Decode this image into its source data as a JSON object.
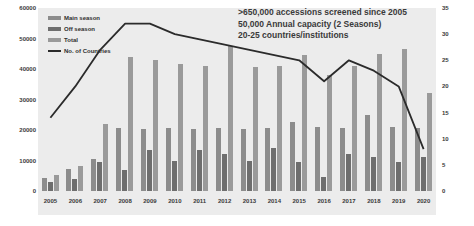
{
  "chart_data": {
    "type": "bar",
    "title": "",
    "annotations": [
      ">650,000 accessions screened since 2005",
      "50,000 Annual capacity (2 Seasons)",
      "20-25 countries/institutions"
    ],
    "categories": [
      "2005",
      "2006",
      "2007",
      "2008",
      "2009",
      "2010",
      "2011",
      "2012",
      "2013",
      "2014",
      "2015",
      "2016",
      "2017",
      "2018",
      "2019",
      "2020"
    ],
    "xlabel": "",
    "ylabel": "",
    "ylim": [
      0,
      60000
    ],
    "yticks": [
      "0",
      "10000",
      "20000",
      "30000",
      "40000",
      "50000",
      "60000"
    ],
    "y2lim": [
      0,
      35
    ],
    "y2ticks": [
      "0",
      "5",
      "10",
      "15",
      "20",
      "25",
      "30",
      "35"
    ],
    "grid": false,
    "legend_position": "top-left",
    "series": [
      {
        "name": "Main season",
        "type": "bar",
        "color": "#8c8c8c",
        "values": [
          4200,
          7200,
          10600,
          20500,
          20200,
          20600,
          20400,
          20700,
          20200,
          20500,
          22500,
          21000,
          20800,
          25000,
          21000,
          20500
        ]
      },
      {
        "name": "Off season",
        "type": "bar",
        "color": "#6e6e6e",
        "values": [
          3000,
          4000,
          9500,
          7000,
          13500,
          10000,
          13500,
          12000,
          9700,
          14000,
          9500,
          4700,
          12000,
          11000,
          9500,
          11000
        ]
      },
      {
        "name": "Total",
        "type": "bar",
        "color": "#9a9a9a",
        "values": [
          5200,
          8200,
          22000,
          44000,
          43000,
          41500,
          41000,
          47500,
          40500,
          41000,
          44500,
          38000,
          41000,
          45000,
          46500,
          32000
        ]
      },
      {
        "name": "No. of Countries",
        "type": "line",
        "color": "#2b2b2b",
        "axis": "right",
        "values": [
          14,
          20,
          27,
          32,
          32,
          30,
          29,
          28,
          27,
          26,
          25,
          21,
          25,
          23,
          20,
          8
        ]
      }
    ]
  },
  "legend": {
    "items": [
      {
        "label": "Main season",
        "swatch": "bar-swatch"
      },
      {
        "label": "Off season",
        "swatch": "bar-swatch"
      },
      {
        "label": "Total",
        "swatch": "bar-swatch"
      },
      {
        "label": "No. of Countries",
        "swatch": "line-swatch"
      }
    ]
  }
}
